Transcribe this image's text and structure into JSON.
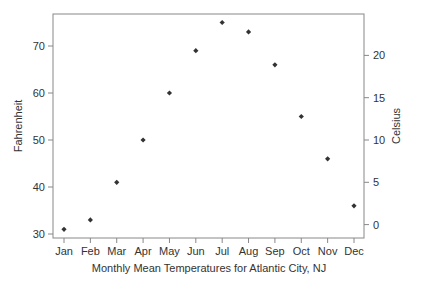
{
  "chart_data": {
    "type": "scatter",
    "title": "",
    "xlabel": "Monthly Mean Temperatures for Atlantic City, NJ",
    "ylabel": "Fahrenheit",
    "ylabel_right": "Celsius",
    "categories": [
      "Jan",
      "Feb",
      "Mar",
      "Apr",
      "May",
      "Jun",
      "Jul",
      "Aug",
      "Sep",
      "Oct",
      "Nov",
      "Dec"
    ],
    "series": [
      {
        "name": "Fahrenheit",
        "values": [
          31,
          33,
          41,
          50,
          60,
          69,
          75,
          73,
          66,
          55,
          46,
          36
        ]
      }
    ],
    "ylim": [
      29.8,
      76.5
    ],
    "yticks": [
      30,
      40,
      50,
      60,
      70
    ],
    "yticks_right": [
      0,
      5,
      10,
      15,
      20
    ],
    "grid": false,
    "legend": "none",
    "marker_color": "#333333"
  }
}
